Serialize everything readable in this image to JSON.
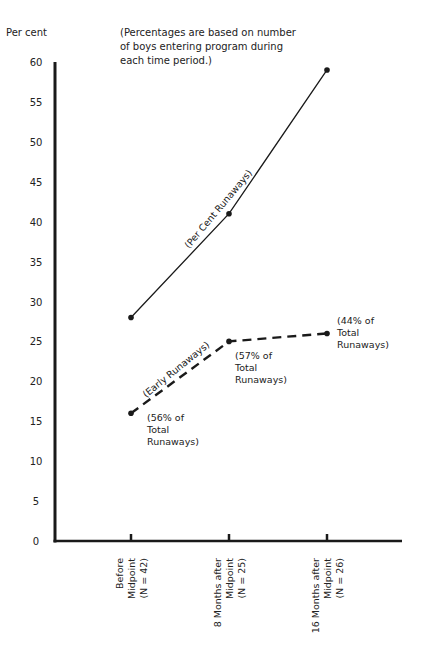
{
  "chart_data": {
    "type": "line",
    "title": "",
    "note": [
      "(Percentages are based on number",
      "of boys entering program during",
      "each time period.)"
    ],
    "ylabel": "Per cent",
    "xlabel": "",
    "ylim": [
      0,
      60
    ],
    "yticks": [
      0,
      5,
      10,
      15,
      20,
      25,
      30,
      35,
      40,
      45,
      50,
      55,
      60
    ],
    "grid": false,
    "legend": "none (series labelled inline along lines)",
    "categories": [
      [
        "Before",
        "Midpoint",
        "(N = 42)"
      ],
      [
        "8 Months after",
        "Midpoint",
        "(N = 25)"
      ],
      [
        "16 Months after",
        "Midpoint",
        "(N = 26)"
      ]
    ],
    "series": [
      {
        "name": "(Per Cent Runaways)",
        "style": "solid",
        "values": [
          28,
          41,
          59
        ]
      },
      {
        "name": "(Early Runaways)",
        "style": "dashed",
        "values": [
          16,
          25,
          26
        ]
      }
    ],
    "annotations": [
      {
        "series": 1,
        "point": 0,
        "lines": [
          "(56% of",
          "Total",
          "Runaways)"
        ]
      },
      {
        "series": 1,
        "point": 1,
        "lines": [
          "(57% of",
          "Total",
          "Runaways)"
        ]
      },
      {
        "series": 1,
        "point": 2,
        "lines": [
          "(44% of",
          "Total",
          "Runaways)"
        ]
      }
    ]
  },
  "colors": {
    "ink": "#1a1a1a",
    "background": "#ffffff"
  }
}
